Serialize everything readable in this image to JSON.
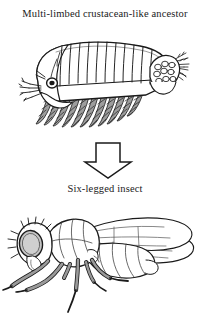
{
  "figure": {
    "background_color": "#ffffff",
    "ink_color": "#1a1a1a",
    "shade_color": "#9a9a9a",
    "light_shade_color": "#c9c9c9",
    "captions": {
      "top": "Multi-limbed crustacean-like ancestor",
      "bottom": "Six-legged insect"
    },
    "panels": [
      {
        "name": "crustacean-ancestor",
        "label": "Multi-limbed crustacean-like ancestor",
        "description": "Lateral view of a branchiopod-like crustacean facing left, with a segmented trunk, a row of eleven feathery phyllopod limbs, a compound eye, antennae, and an egg sac with a feathery tail at the rear.",
        "limb_count": 11,
        "trunk_segment_count": 11
      },
      {
        "name": "arrow",
        "label": "downward evolution arrow",
        "direction": "down"
      },
      {
        "name": "six-legged-insect",
        "label": "Six-legged insect",
        "description": "Lateral view of a fly facing left with a large compound eye, bristled head, two membranous veined wings, a banded abdomen, and six legs.",
        "leg_count": 6,
        "wing_count": 2
      }
    ]
  }
}
